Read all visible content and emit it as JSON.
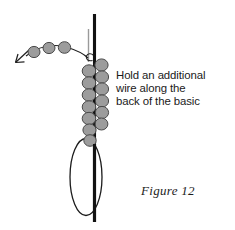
{
  "figure": {
    "caption": "Figure 12",
    "instruction": {
      "line1": "Hold an additional",
      "line2": "wire along the",
      "line3": "back of the basic"
    },
    "colors": {
      "bead_fill": "#9c9c9c",
      "bead_stroke": "#4a4a4a",
      "basic_wire": "#121212",
      "additional_wire": "#9a9a9a",
      "loop_stroke": "#1c1c1c",
      "text": "#1a1a1a",
      "background": "#ffffff"
    },
    "elements": {
      "basic_wire_label": "basic-wire",
      "additional_wire_label": "additional-wire",
      "loop_label": "wire-loop",
      "arrow_label": "direction-arrow",
      "bead_count_left_column": 7,
      "bead_count_right_column": 6,
      "bead_count_strand": 3
    }
  }
}
